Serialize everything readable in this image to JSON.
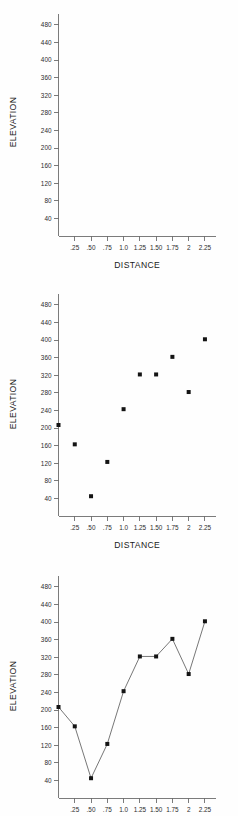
{
  "figure": {
    "background_color": "#fefefe",
    "marker_color": "#141414",
    "axis_color": "#6d6d6d",
    "line_color": "#4a4a4a"
  },
  "panels": [
    {
      "name": "empty-axes",
      "xlabel": "DISTANCE",
      "ylabel": "ELEVATION",
      "has_xlabel": true,
      "has_points": false,
      "has_line": false
    },
    {
      "name": "scatter-plot",
      "xlabel": "DISTANCE",
      "ylabel": "ELEVATION",
      "has_xlabel": true,
      "has_points": true,
      "has_line": false
    },
    {
      "name": "line-plot",
      "xlabel": "",
      "ylabel": "ELEVATION",
      "has_xlabel": false,
      "has_points": true,
      "has_line": true
    }
  ],
  "chart_data": [
    {
      "type": "scatter",
      "title": "",
      "xlabel": "DISTANCE",
      "ylabel": "ELEVATION",
      "xticklabels": [
        ".25",
        ".50",
        ".75",
        "1.0",
        "1.25",
        "1.50",
        "1.75",
        "2",
        "2.25"
      ],
      "xticks": [
        0.25,
        0.5,
        0.75,
        1.0,
        1.25,
        1.5,
        1.75,
        2.0,
        2.25
      ],
      "yticklabels": [
        "40",
        "80",
        "120",
        "160",
        "200",
        "240",
        "280",
        "320",
        "360",
        "400",
        "440",
        "480"
      ],
      "yticks": [
        40,
        80,
        120,
        160,
        200,
        240,
        280,
        320,
        360,
        400,
        440,
        480
      ],
      "xlim": [
        0,
        2.42
      ],
      "ylim": [
        0,
        505
      ],
      "grid": false,
      "legend": false,
      "x": [],
      "y": []
    },
    {
      "type": "scatter",
      "title": "",
      "xlabel": "DISTANCE",
      "ylabel": "ELEVATION",
      "xticklabels": [
        ".25",
        ".50",
        ".75",
        "1.0",
        "1.25",
        "1.50",
        "1.75",
        "2",
        "2.25"
      ],
      "xticks": [
        0.25,
        0.5,
        0.75,
        1.0,
        1.25,
        1.5,
        1.75,
        2.0,
        2.25
      ],
      "yticklabels": [
        "40",
        "80",
        "120",
        "160",
        "200",
        "240",
        "280",
        "320",
        "360",
        "400",
        "440",
        "480"
      ],
      "yticks": [
        40,
        80,
        120,
        160,
        200,
        240,
        280,
        320,
        360,
        400,
        440,
        480
      ],
      "xlim": [
        0,
        2.42
      ],
      "ylim": [
        0,
        505
      ],
      "grid": false,
      "legend": false,
      "x": [
        0.0,
        0.25,
        0.5,
        0.75,
        1.0,
        1.25,
        1.5,
        1.75,
        2.0,
        2.25
      ],
      "y": [
        207,
        163,
        45,
        123,
        243,
        322,
        322,
        362,
        282,
        402
      ]
    },
    {
      "type": "line",
      "title": "",
      "xlabel": "",
      "ylabel": "ELEVATION",
      "xticklabels": [
        ".25",
        ".50",
        ".75",
        "1.0",
        "1.25",
        "1.50",
        "1.75",
        "2",
        "2.25"
      ],
      "xticks": [
        0.25,
        0.5,
        0.75,
        1.0,
        1.25,
        1.5,
        1.75,
        2.0,
        2.25
      ],
      "yticklabels": [
        "40",
        "80",
        "120",
        "160",
        "200",
        "240",
        "280",
        "320",
        "360",
        "400",
        "440",
        "480"
      ],
      "yticks": [
        40,
        80,
        120,
        160,
        200,
        240,
        280,
        320,
        360,
        400,
        440,
        480
      ],
      "xlim": [
        0,
        2.42
      ],
      "ylim": [
        0,
        505
      ],
      "grid": false,
      "legend": false,
      "markers": true,
      "x": [
        0.0,
        0.25,
        0.5,
        0.75,
        1.0,
        1.25,
        1.5,
        1.75,
        2.0,
        2.25
      ],
      "y": [
        207,
        163,
        45,
        123,
        243,
        322,
        322,
        362,
        282,
        402
      ]
    }
  ]
}
